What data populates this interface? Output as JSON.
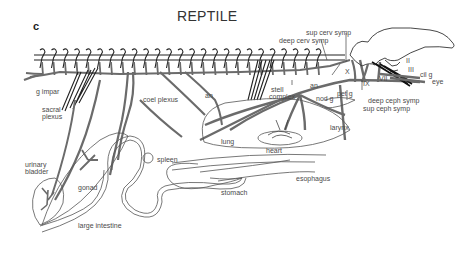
{
  "figure": {
    "panel_letter": "c",
    "title": "REPTILE",
    "colors": {
      "nerve": "#6b6b6b",
      "outline": "#555555",
      "chain": "#222222",
      "text": "#4a4a4a"
    }
  },
  "labels": {
    "sup_cerv_symp": "sup cerv symp",
    "deep_cerv_symp": "deep cerv symp",
    "X": "X",
    "II": "II",
    "III": "III",
    "cil_g": "cil g",
    "eye": "eye",
    "VII": "VII",
    "IX": "IX",
    "pet_g": "pet g",
    "deep_ceph_symp": "deep ceph symp",
    "sup_ceph_symp": "sup ceph symp",
    "an_right": "an",
    "nod_g": "nod g",
    "stell_complex_1": "stell",
    "stell_complex_2": "complex",
    "larynx": "larynx",
    "heart": "heart",
    "lung": "lung",
    "an_left": "an",
    "g_impar": "g impar",
    "sacral_plexus_1": "sacral",
    "sacral_plexus_2": "plexus",
    "coel_plexus": "coel plexus",
    "spleen": "spleen",
    "stomach": "stomach",
    "esophagus": "esophagus",
    "urinary_bladder_1": "urinary",
    "urinary_bladder_2": "bladder",
    "gonad": "gonad",
    "large_intestine": "large intestine"
  }
}
